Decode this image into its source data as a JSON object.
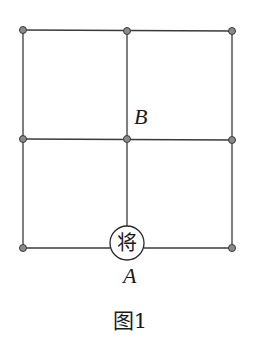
{
  "figure": {
    "caption": "图1",
    "grid": {
      "columns_x": [
        23,
        127,
        232
      ],
      "rows_y": [
        30,
        139,
        248
      ]
    },
    "piece": {
      "char": "将",
      "label": "A",
      "position": "bottom-middle"
    },
    "point_B": {
      "label": "B",
      "position": "center"
    },
    "colors": {
      "line": "#3a3a3a",
      "node_fill": "#8a8a8a",
      "background": "#ffffff"
    }
  }
}
